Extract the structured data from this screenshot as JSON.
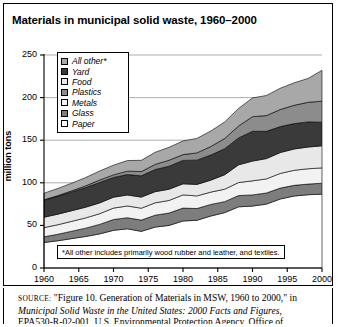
{
  "figure": {
    "title": "Materials in municipal solid waste, 1960–2000",
    "footnote": "*All other includes primarily wood rubber and leather, and textiles.",
    "source": {
      "label": "SOURCE:",
      "part1": "\"Figure 10. Generation of Materials in MSW, 1960 to 2000,\" in",
      "italic": "Municipal Solid Waste in the United States: 2000 Facts and Figures",
      "part2": ", EPA530-R-02-001, U.S. Environmental Protection Agency, Office of"
    }
  },
  "chart_data": {
    "type": "area",
    "title": "Materials in municipal solid waste, 1960–2000",
    "xlabel": "",
    "ylabel": "million tons",
    "xlim": [
      1960,
      2000
    ],
    "ylim": [
      0,
      250
    ],
    "xticks": [
      1960,
      1965,
      1970,
      1975,
      1980,
      1985,
      1990,
      1995,
      2000
    ],
    "yticks": [
      0,
      50,
      100,
      150,
      200,
      250
    ],
    "grid": true,
    "stacked": true,
    "legend_position": "upper-left-inside",
    "x": [
      1960,
      1962,
      1964,
      1966,
      1968,
      1970,
      1972,
      1974,
      1976,
      1978,
      1980,
      1982,
      1984,
      1986,
      1988,
      1990,
      1992,
      1994,
      1996,
      1998,
      2000
    ],
    "stack_order_bottom_to_top": [
      "Paper",
      "Glass",
      "Metals",
      "Food",
      "Yard",
      "Plastics",
      "All other*"
    ],
    "series": [
      {
        "name": "Paper",
        "swatch": "#ffffff",
        "values": [
          29.9,
          32.0,
          34.5,
          37.0,
          40.0,
          44.2,
          46.0,
          43.0,
          48.0,
          50.0,
          55.2,
          56.0,
          61.0,
          65.0,
          71.8,
          72.7,
          75.0,
          81.0,
          84.5,
          86.0,
          86.7
        ]
      },
      {
        "name": "Glass",
        "swatch": "#7d7d7d",
        "values": [
          6.7,
          7.6,
          8.7,
          9.8,
          11.2,
          12.7,
          13.0,
          13.2,
          14.0,
          14.5,
          15.1,
          13.8,
          13.6,
          12.9,
          13.2,
          13.1,
          13.0,
          12.8,
          12.5,
          12.5,
          12.8
        ]
      },
      {
        "name": "Metals",
        "swatch": "#f2f2f2",
        "values": [
          10.8,
          11.2,
          11.6,
          12.0,
          12.5,
          13.4,
          13.8,
          14.0,
          14.5,
          14.8,
          15.5,
          14.8,
          14.5,
          14.6,
          15.3,
          16.5,
          16.6,
          17.2,
          17.7,
          18.0,
          18.0
        ]
      },
      {
        "name": "Food",
        "swatch": "#e8e8e8",
        "values": [
          12.2,
          12.4,
          12.5,
          12.6,
          12.7,
          12.8,
          12.9,
          13.0,
          13.1,
          13.2,
          13.0,
          13.5,
          14.0,
          17.0,
          20.8,
          23.2,
          23.8,
          24.5,
          25.0,
          25.5,
          25.9
        ]
      },
      {
        "name": "Yard",
        "swatch": "#3a3a3a",
        "values": [
          20.0,
          21.0,
          22.0,
          23.0,
          24.0,
          23.2,
          24.0,
          25.0,
          26.0,
          27.0,
          27.5,
          28.5,
          29.5,
          30.5,
          31.6,
          35.0,
          32.0,
          30.5,
          29.8,
          29.5,
          27.7
        ]
      },
      {
        "name": "Plastics",
        "swatch": "#8c8c8c",
        "values": [
          0.4,
          0.8,
          1.3,
          2.0,
          2.8,
          3.0,
          4.0,
          5.0,
          6.0,
          7.0,
          6.8,
          8.5,
          10.0,
          12.0,
          14.0,
          17.1,
          18.5,
          20.0,
          21.5,
          23.0,
          24.7
        ]
      },
      {
        "name": "All other*",
        "swatch": "#a8a8a8",
        "values": [
          7.8,
          8.4,
          9.0,
          9.8,
          10.6,
          11.4,
          12.4,
          13.2,
          14.2,
          15.2,
          16.0,
          17.0,
          18.2,
          19.4,
          20.6,
          22.0,
          23.6,
          25.0,
          26.4,
          28.0,
          36.2
        ]
      }
    ],
    "totals": [
      87.8,
      93.4,
      99.6,
      106.2,
      113.8,
      120.7,
      126.1,
      126.4,
      135.8,
      141.7,
      149.1,
      152.1,
      160.8,
      171.4,
      187.3,
      199.6,
      202.5,
      211.0,
      217.4,
      222.5,
      232.0
    ]
  },
  "legend": {
    "items": [
      {
        "label": "All other*",
        "color": "#a8a8a8"
      },
      {
        "label": "Yard",
        "color": "#3a3a3a"
      },
      {
        "label": "Food",
        "color": "#e8e8e8"
      },
      {
        "label": "Plastics",
        "color": "#8c8c8c"
      },
      {
        "label": "Metals",
        "color": "#f2f2f2"
      },
      {
        "label": "Glass",
        "color": "#7d7d7d"
      },
      {
        "label": "Paper",
        "color": "#ffffff"
      }
    ]
  }
}
